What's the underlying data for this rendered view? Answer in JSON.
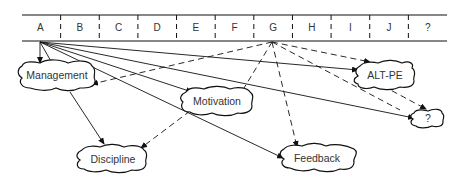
{
  "strip": {
    "cells": [
      "A",
      "B",
      "C",
      "D",
      "E",
      "F",
      "G",
      "H",
      "I",
      "J",
      "?"
    ]
  },
  "nodes": {
    "management": "Management",
    "motivation": "Motivation",
    "discipline": "Discipline",
    "feedback": "Feedback",
    "altpe": "ALT-PE",
    "unknown": "?"
  },
  "edges": [
    {
      "from": "A",
      "to": "Management",
      "style": "solid"
    },
    {
      "from": "A",
      "to": "Motivation",
      "style": "solid"
    },
    {
      "from": "A",
      "to": "ALT-PE",
      "style": "solid"
    },
    {
      "from": "A",
      "to": "?",
      "style": "solid"
    },
    {
      "from": "A",
      "to": "Feedback",
      "style": "solid"
    },
    {
      "from": "Management",
      "to": "Discipline",
      "style": "solid"
    },
    {
      "from": "G",
      "to": "Management",
      "style": "dashed"
    },
    {
      "from": "G",
      "to": "Motivation",
      "style": "dashed"
    },
    {
      "from": "G",
      "to": "Feedback",
      "style": "dashed"
    },
    {
      "from": "G",
      "to": "ALT-PE",
      "style": "dashed"
    },
    {
      "from": "G",
      "to": "?",
      "style": "dashed"
    },
    {
      "from": "Motivation",
      "to": "Discipline",
      "style": "dashed"
    }
  ]
}
